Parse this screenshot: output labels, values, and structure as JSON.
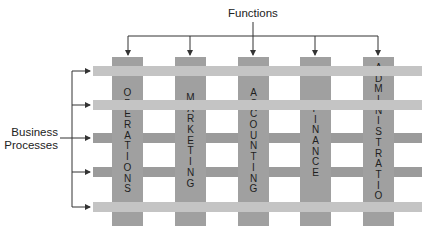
{
  "diagram": {
    "top_label": "Functions",
    "side_label_line1": "Business",
    "side_label_line2": "Processes",
    "functions": [
      {
        "label": "OPERATIONS",
        "letters": [
          "O",
          "P",
          "E",
          "R",
          "A",
          "T",
          "I",
          "O",
          "N",
          "S"
        ]
      },
      {
        "label": "MARKETING",
        "letters": [
          "M",
          "A",
          "R",
          "K",
          "E",
          "T",
          "I",
          "N",
          "G"
        ]
      },
      {
        "label": "ACCOUNTING",
        "letters": [
          "A",
          "C",
          "C",
          "O",
          "U",
          "N",
          "T",
          "I",
          "N",
          "G"
        ]
      },
      {
        "label": "FINANCE",
        "letters": [
          "F",
          "I",
          "N",
          "A",
          "N",
          "C",
          "E"
        ]
      },
      {
        "label": "ADMINISTRATION",
        "letters": [
          "A",
          "D",
          "M",
          "I",
          "N",
          "I",
          "S",
          "T",
          "R",
          "A",
          "T",
          "I",
          "O",
          "N"
        ]
      }
    ],
    "process_rows": [
      {
        "shade": "light"
      },
      {
        "shade": "light"
      },
      {
        "shade": "dark"
      },
      {
        "shade": "dark"
      },
      {
        "shade": "light"
      }
    ],
    "colors": {
      "column": "#a0a0a0",
      "row_light": "#c4c4c4",
      "row_dark": "#9b9b9b",
      "lines": "#333333"
    }
  }
}
